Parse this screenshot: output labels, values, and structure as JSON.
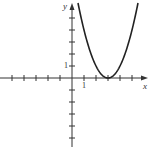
{
  "chart_data": {
    "type": "line",
    "title": "",
    "xlabel": "x",
    "ylabel": "y",
    "x_tick_label": "1",
    "y_tick_label": "1",
    "xlim": [
      -6,
      6
    ],
    "ylim": [
      -6,
      6
    ],
    "x_ticks": [
      -5,
      -4,
      -3,
      -2,
      -1,
      1,
      2,
      3,
      4,
      5
    ],
    "y_ticks": [
      -5,
      -4,
      -3,
      -2,
      -1,
      1,
      2,
      3,
      4,
      5
    ],
    "grid": false,
    "series": [
      {
        "name": "y = (x - 3)^2",
        "x": [
          0.5,
          1,
          1.5,
          2,
          2.5,
          3,
          3.5,
          4,
          4.5,
          5,
          5.5
        ],
        "y": [
          6.25,
          4,
          2.25,
          1,
          0.25,
          0,
          0.25,
          1,
          2.25,
          4,
          6.25
        ]
      }
    ],
    "vertex": [
      3,
      0
    ],
    "color": "#222222"
  }
}
